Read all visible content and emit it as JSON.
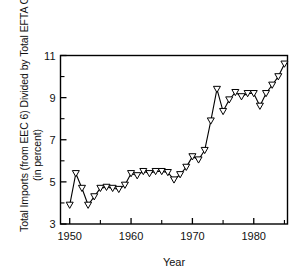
{
  "chart_data": {
    "type": "line",
    "title": "",
    "xlabel": "Year",
    "ylabel": "Total Imports (from EEC 6) Divided by Total EFTA GDP (in percent)",
    "ylabel_line1": "Total Imports (from EEC 6) Divided by Total EFTA GDP",
    "ylabel_line2": "(in percent)",
    "xlim": [
      1948.5,
      1985.5
    ],
    "ylim": [
      3,
      11
    ],
    "grid": false,
    "legend": null,
    "marker": "open-triangle-down",
    "line_color": "#000000",
    "xticks": [
      1950,
      1960,
      1970,
      1980
    ],
    "xtick_labels": [
      "1950",
      "1960",
      "1970",
      "1980"
    ],
    "xminor_ticks": [
      1955,
      1965,
      1975,
      1985
    ],
    "yticks": [
      3,
      5,
      7,
      9,
      11
    ],
    "ytick_labels": [
      "3",
      "5",
      "7",
      "9",
      "11"
    ],
    "yminor_ticks": [
      4,
      6,
      8,
      10
    ],
    "x": [
      1950,
      1951,
      1952,
      1953,
      1954,
      1955,
      1956,
      1957,
      1958,
      1959,
      1960,
      1961,
      1962,
      1963,
      1964,
      1965,
      1966,
      1967,
      1968,
      1969,
      1970,
      1971,
      1972,
      1973,
      1974,
      1975,
      1976,
      1977,
      1978,
      1979,
      1980,
      1981,
      1982,
      1983,
      1984,
      1985
    ],
    "values": [
      3.9,
      5.4,
      4.7,
      3.9,
      4.3,
      4.7,
      4.75,
      4.7,
      4.65,
      4.85,
      5.4,
      5.3,
      5.5,
      5.4,
      5.5,
      5.5,
      5.45,
      5.1,
      5.35,
      5.7,
      6.2,
      6.05,
      6.5,
      7.9,
      9.4,
      8.35,
      8.9,
      9.25,
      9.05,
      9.2,
      9.2,
      8.6,
      9.2,
      9.6,
      10.0,
      10.6
    ]
  }
}
